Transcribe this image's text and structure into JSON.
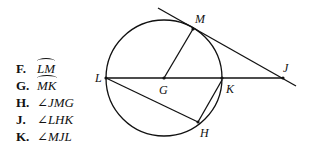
{
  "choices": [
    {
      "letter": "F.",
      "text": "LM",
      "kind": "arc"
    },
    {
      "letter": "G.",
      "text": "MK",
      "kind": "arc"
    },
    {
      "letter": "H.",
      "text": "∠JMG",
      "kind": "angle"
    },
    {
      "letter": "J.",
      "text": "∠LHK",
      "kind": "angle"
    },
    {
      "letter": "K.",
      "text": "∠MJL",
      "kind": "angle"
    }
  ],
  "diagram": {
    "points": {
      "M": "M",
      "L": "L",
      "G": "G",
      "K": "K",
      "J": "J",
      "H": "H"
    },
    "colors": {
      "stroke": "#111111",
      "background": "#ffffff"
    }
  }
}
